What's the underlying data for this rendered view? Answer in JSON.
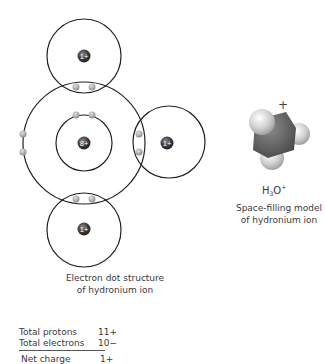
{
  "electron_dot": {
    "oxygen_nucleus_label": "8+",
    "hydrogen_nucleus_label": "1+",
    "caption_line1": "Electron dot structure",
    "caption_line2": "of hydronium ion"
  },
  "space_filling": {
    "charge_symbol": "+",
    "formula_h": "H",
    "formula_sub": "3",
    "formula_o": "O",
    "formula_sup": "+",
    "caption_line1": "Space-filling model",
    "caption_line2": "of hydronium ion"
  },
  "charge_table": {
    "rows": [
      {
        "label": "Total protons",
        "value": "11+"
      },
      {
        "label": "Total electrons",
        "value": "10−"
      }
    ],
    "total": {
      "label": "Net charge",
      "value": "1+"
    }
  },
  "colors": {
    "line": "#222222",
    "nucleus": "#3c3c3c",
    "electron": "#a9a9a9",
    "oxygen_sphere": "#6a6a6a",
    "hydrogen_sphere": "#d8d8d8"
  }
}
